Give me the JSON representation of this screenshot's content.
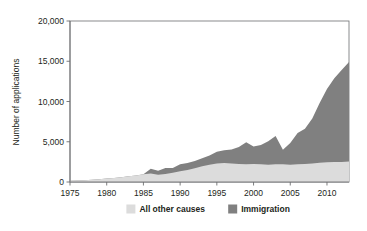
{
  "chart_data": {
    "type": "area",
    "stacked": true,
    "title": "",
    "subtitle": "",
    "xlabel": "",
    "ylabel": "Number of applications",
    "xlim": [
      1975,
      2013
    ],
    "ylim": [
      0,
      20000
    ],
    "grid": false,
    "legend_position": "bottom",
    "xticks": [
      1975,
      1980,
      1985,
      1990,
      1995,
      2000,
      2005,
      2010
    ],
    "xtick_labels": [
      "1975",
      "1980",
      "1985",
      "1990",
      "1995",
      "2000",
      "2005",
      "2010"
    ],
    "yticks": [
      0,
      5000,
      10000,
      15000,
      20000
    ],
    "ytick_labels": [
      "0",
      "5,000",
      "10,000",
      "15,000",
      "20,000"
    ],
    "x": [
      1975,
      1976,
      1977,
      1978,
      1979,
      1980,
      1981,
      1982,
      1983,
      1984,
      1985,
      1986,
      1987,
      1988,
      1989,
      1990,
      1991,
      1992,
      1993,
      1994,
      1995,
      1996,
      1997,
      1998,
      1999,
      2000,
      2001,
      2002,
      2003,
      2004,
      2005,
      2006,
      2007,
      2008,
      2009,
      2010,
      2011,
      2012,
      2013
    ],
    "series": [
      {
        "name": "All other causes",
        "color": "#dcdcdc",
        "values": [
          150,
          180,
          220,
          280,
          340,
          420,
          500,
          600,
          700,
          820,
          950,
          1050,
          900,
          1000,
          1150,
          1350,
          1500,
          1700,
          1950,
          2150,
          2300,
          2350,
          2300,
          2250,
          2200,
          2250,
          2200,
          2150,
          2200,
          2200,
          2150,
          2200,
          2250,
          2300,
          2400,
          2450,
          2500,
          2500,
          2550
        ]
      },
      {
        "name": "Immigration",
        "color": "#808080",
        "values": [
          0,
          0,
          0,
          0,
          0,
          0,
          0,
          0,
          0,
          0,
          0,
          600,
          500,
          750,
          600,
          850,
          850,
          900,
          1000,
          1150,
          1450,
          1600,
          1750,
          2100,
          2750,
          2150,
          2400,
          2900,
          3500,
          1800,
          2700,
          3900,
          4350,
          5600,
          7400,
          9100,
          10400,
          11400,
          12350
        ]
      }
    ],
    "totals": [
      150,
      180,
      220,
      280,
      340,
      420,
      500,
      600,
      700,
      820,
      950,
      1650,
      1400,
      1750,
      1750,
      2200,
      2350,
      2600,
      2950,
      3300,
      3750,
      3950,
      4050,
      4350,
      4950,
      4400,
      4600,
      5050,
      5700,
      4000,
      4850,
      6100,
      6600,
      7900,
      9800,
      11550,
      12900,
      13900,
      14900
    ]
  },
  "legend": {
    "items": [
      {
        "label": "All other causes",
        "color": "#dcdcdc"
      },
      {
        "label": "Immigration",
        "color": "#808080"
      }
    ]
  },
  "axis": {
    "ylabel": "Number of applications"
  }
}
